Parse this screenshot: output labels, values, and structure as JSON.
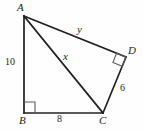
{
  "figure": {
    "type": "geometry-diagram",
    "shape": "quadrilateral",
    "stroke_color": "#231f20",
    "background_color": "#fefefe"
  },
  "vertices": {
    "A": {
      "label": "A",
      "x": 24,
      "y": 16
    },
    "B": {
      "label": "B",
      "x": 24,
      "y": 113
    },
    "C": {
      "label": "C",
      "x": 103,
      "y": 113
    },
    "D": {
      "label": "D",
      "x": 126,
      "y": 57
    }
  },
  "segments": {
    "AB": {
      "label": "10",
      "from": "A",
      "to": "B"
    },
    "BC": {
      "label": "8",
      "from": "B",
      "to": "C"
    },
    "CD": {
      "label": "6",
      "from": "C",
      "to": "D"
    },
    "AD": {
      "label": "y",
      "from": "A",
      "to": "D"
    },
    "AC": {
      "label": "x",
      "from": "A",
      "to": "C"
    }
  },
  "right_angles": [
    {
      "at": "B",
      "marker": "right-angle-square"
    },
    {
      "at": "D",
      "marker": "right-angle-square"
    }
  ]
}
